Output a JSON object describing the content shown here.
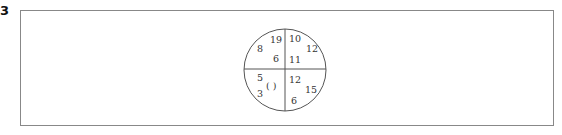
{
  "question_number": "3",
  "circle_puzzle": {
    "top_left": {
      "values": [
        "19",
        "8",
        "6"
      ]
    },
    "top_right": {
      "values": [
        "10",
        "12",
        "11"
      ]
    },
    "bottom_left": {
      "values": [
        "5",
        "3"
      ],
      "blank": "(    )"
    },
    "bottom_right": {
      "values": [
        "12",
        "15",
        "6"
      ]
    }
  }
}
